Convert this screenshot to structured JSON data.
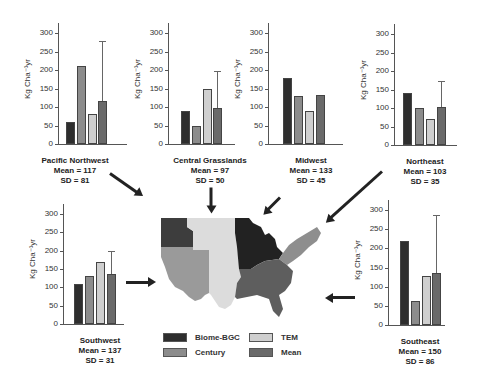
{
  "colors": {
    "biome_bgc": "#2e2e2e",
    "century": "#8c8c8c",
    "tem": "#cfcfcf",
    "mean": "#6a6a6a"
  },
  "legend": {
    "items": [
      {
        "label": "Biome-BGC",
        "color": "#2e2e2e"
      },
      {
        "label": "Century",
        "color": "#8c8c8c"
      },
      {
        "label": "TEM",
        "color": "#cfcfcf"
      },
      {
        "label": "Mean",
        "color": "#6a6a6a"
      }
    ]
  },
  "axis": {
    "ylabel": "Kg Cha⁻¹yr",
    "ticks": [
      "300",
      "250",
      "200",
      "150",
      "100",
      "50",
      "0"
    ]
  },
  "panels": {
    "pacific_northwest": {
      "name": "Pacific Northwest",
      "mean_label": "Mean = 117",
      "sd_label": "SD = 81"
    },
    "central_grasslands": {
      "name": "Central Grasslands",
      "mean_label": "Mean = 97",
      "sd_label": "SD = 50"
    },
    "midwest": {
      "name": "Midwest",
      "mean_label": "Mean = 133",
      "sd_label": "SD = 45"
    },
    "northeast": {
      "name": "Northeast",
      "mean_label": "Mean = 103",
      "sd_label": "SD = 35"
    },
    "southwest": {
      "name": "Southwest",
      "mean_label": "Mean = 137",
      "sd_label": "SD = 31"
    },
    "southeast": {
      "name": "Southeast",
      "mean_label": "Mean = 150",
      "sd_label": "SD = 86"
    }
  },
  "chart_data": [
    {
      "type": "bar",
      "title": "Pacific Northwest",
      "subtitle": "Mean = 117, SD = 81",
      "ylabel": "Kg Cha-1yr",
      "ylim": [
        0,
        300
      ],
      "categories": [
        "Biome-BGC",
        "Century",
        "TEM",
        "Mean"
      ],
      "values": [
        60,
        210,
        80,
        117
      ],
      "error_bar_mean": 162
    },
    {
      "type": "bar",
      "title": "Central Grasslands",
      "subtitle": "Mean = 97, SD = 50",
      "ylabel": "Kg Cha-1yr",
      "ylim": [
        0,
        300
      ],
      "categories": [
        "Biome-BGC",
        "Century",
        "TEM",
        "Mean"
      ],
      "values": [
        90,
        50,
        148,
        97
      ],
      "error_bar_mean": 100
    },
    {
      "type": "bar",
      "title": "Midwest",
      "subtitle": "Mean = 133, SD = 45",
      "ylabel": "Kg Cha-1yr",
      "ylim": [
        0,
        300
      ],
      "categories": [
        "Biome-BGC",
        "Century",
        "TEM",
        "Mean"
      ],
      "values": [
        178,
        129,
        90,
        133
      ],
      "error_bar_mean": 0
    },
    {
      "type": "bar",
      "title": "Northeast",
      "subtitle": "Mean = 103, SD = 35",
      "ylabel": "Kg Cha-1yr",
      "ylim": [
        0,
        300
      ],
      "categories": [
        "Biome-BGC",
        "Century",
        "TEM",
        "Mean"
      ],
      "values": [
        140,
        100,
        70,
        103
      ],
      "error_bar_mean": 70
    },
    {
      "type": "bar",
      "title": "Southwest",
      "subtitle": "Mean = 137, SD = 31",
      "ylabel": "Kg Cha-1yr",
      "ylim": [
        0,
        300
      ],
      "categories": [
        "Biome-BGC",
        "Century",
        "TEM",
        "Mean"
      ],
      "values": [
        110,
        130,
        170,
        137
      ],
      "error_bar_mean": 62
    },
    {
      "type": "bar",
      "title": "Southeast",
      "subtitle": "Mean = 150, SD = 86",
      "ylabel": "Kg Cha-1yr",
      "ylim": [
        0,
        300
      ],
      "categories": [
        "Biome-BGC",
        "Century",
        "TEM",
        "Mean"
      ],
      "values": [
        220,
        62,
        128,
        136
      ],
      "error_bar_mean": 152
    }
  ]
}
